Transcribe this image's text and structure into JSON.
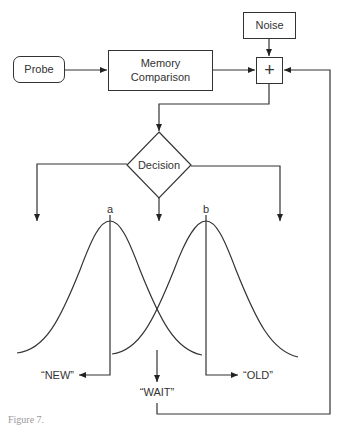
{
  "diagram": {
    "nodes": {
      "probe": "Probe",
      "memory_comparison": "Memory Comparison",
      "noise": "Noise",
      "sum": "+",
      "decision": "Decision"
    },
    "distributions": {
      "a_label": "a",
      "b_label": "b"
    },
    "responses": {
      "new": "“NEW”",
      "wait": "“WAIT”",
      "old": "“OLD”"
    },
    "caption": "Figure 7."
  },
  "colors": {
    "stroke": "#333333",
    "background": "#ffffff"
  }
}
